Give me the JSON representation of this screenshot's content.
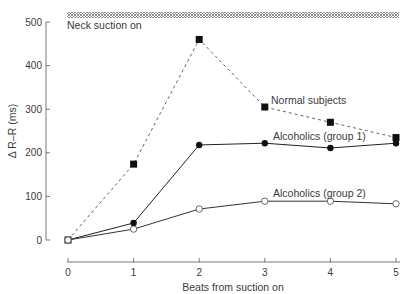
{
  "chart_data": {
    "type": "line",
    "title": "",
    "xlabel": "Beats from suction on",
    "ylabel": "Δ R–R (ms)",
    "x": [
      0,
      1,
      2,
      3,
      4,
      5
    ],
    "xticks": [
      "0",
      "1",
      "2",
      "3",
      "4",
      "5"
    ],
    "yticks": [
      "0",
      "100",
      "200",
      "300",
      "400",
      "500"
    ],
    "xlim": [
      0,
      5
    ],
    "ylim": [
      0,
      500
    ],
    "grid": false,
    "annotations": {
      "band_label": "Neck suction on"
    },
    "series": [
      {
        "name": "Normal subjects",
        "marker": "filled-square",
        "line": "dashed",
        "values": [
          0,
          174,
          460,
          305,
          270,
          235
        ]
      },
      {
        "name": "Alcoholics (group 1)",
        "marker": "filled-circle",
        "line": "solid",
        "values": [
          0,
          39,
          218,
          222,
          211,
          222
        ]
      },
      {
        "name": "Alcoholics (group 2)",
        "marker": "open-circle",
        "line": "solid",
        "values": [
          0,
          25,
          71,
          89,
          89,
          83
        ]
      }
    ]
  }
}
